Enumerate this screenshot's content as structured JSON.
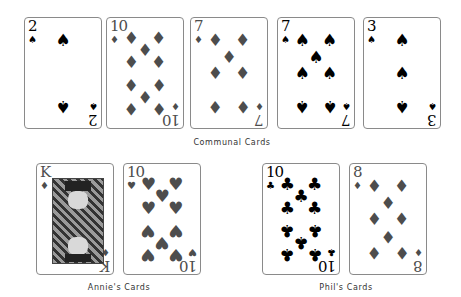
{
  "groups": {
    "communal": {
      "label": "Communal Cards"
    },
    "annie": {
      "label": "Annie's Cards"
    },
    "phil": {
      "label": "Phil's Cards"
    }
  },
  "cards": [
    {
      "id": "communal-1",
      "rank": "2",
      "suit": "spades",
      "glyph": "♠",
      "color": "black"
    },
    {
      "id": "communal-2",
      "rank": "10",
      "suit": "diamonds",
      "glyph": "♦",
      "color": "red"
    },
    {
      "id": "communal-3",
      "rank": "7",
      "suit": "diamonds",
      "glyph": "♦",
      "color": "red"
    },
    {
      "id": "communal-4",
      "rank": "7",
      "suit": "spades",
      "glyph": "♠",
      "color": "black"
    },
    {
      "id": "communal-5",
      "rank": "3",
      "suit": "spades",
      "glyph": "♠",
      "color": "black"
    },
    {
      "id": "annie-1",
      "rank": "K",
      "suit": "diamonds",
      "glyph": "♦",
      "color": "red"
    },
    {
      "id": "annie-2",
      "rank": "10",
      "suit": "hearts",
      "glyph": "♥",
      "color": "red"
    },
    {
      "id": "phil-1",
      "rank": "10",
      "suit": "clubs",
      "glyph": "♣",
      "color": "black"
    },
    {
      "id": "phil-2",
      "rank": "8",
      "suit": "diamonds",
      "glyph": "♦",
      "color": "red"
    }
  ],
  "colors": {
    "black_suit": "#000000",
    "red_suit": "#4d4d4d",
    "border": "#8a8a8a"
  }
}
